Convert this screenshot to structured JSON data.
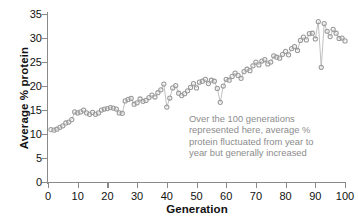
{
  "chart_data": {
    "type": "line",
    "title": "",
    "xlabel": "Generation",
    "ylabel": "Average % protein",
    "xlim": [
      0,
      100
    ],
    "ylim": [
      0,
      35
    ],
    "xticks": [
      0,
      10,
      20,
      30,
      40,
      50,
      60,
      70,
      80,
      90,
      100
    ],
    "yticks": [
      0,
      5,
      10,
      15,
      20,
      25,
      30,
      35
    ],
    "grid": false,
    "legend": null,
    "marker": "open-circle",
    "marker_color": "#9a9a9a",
    "line_color": "#b0b0b0",
    "annotations": [
      {
        "text": "Over the 100 generations represented here, average % protein fluctuated from year to year but generally increased",
        "lines": [
          "Over the 100 generations",
          "represented here, average %",
          "protein fluctuated from year to",
          "year but generally increased"
        ],
        "color": "#8c8c8c",
        "x": 52,
        "y": 12
      }
    ],
    "x": [
      1,
      2,
      3,
      4,
      5,
      6,
      7,
      8,
      9,
      10,
      11,
      12,
      13,
      14,
      15,
      16,
      17,
      18,
      19,
      20,
      21,
      22,
      23,
      24,
      25,
      26,
      27,
      28,
      29,
      30,
      31,
      32,
      33,
      34,
      35,
      36,
      37,
      38,
      39,
      40,
      41,
      42,
      43,
      44,
      45,
      46,
      47,
      48,
      49,
      50,
      51,
      52,
      53,
      54,
      55,
      56,
      57,
      58,
      59,
      60,
      61,
      62,
      63,
      64,
      65,
      66,
      67,
      68,
      69,
      70,
      71,
      72,
      73,
      74,
      75,
      76,
      77,
      78,
      79,
      80,
      81,
      82,
      83,
      84,
      85,
      86,
      87,
      88,
      89,
      90,
      91,
      92,
      93,
      94,
      95,
      96,
      97,
      98,
      99,
      100
    ],
    "values": [
      10.9,
      10.8,
      11.0,
      11.4,
      11.7,
      12.3,
      12.5,
      13.0,
      14.6,
      14.4,
      14.6,
      15.0,
      14.4,
      14.1,
      14.5,
      14.1,
      14.4,
      15.0,
      15.2,
      15.3,
      15.5,
      15.4,
      15.2,
      14.4,
      14.3,
      16.9,
      17.2,
      17.4,
      16.2,
      16.5,
      17.3,
      16.8,
      17.0,
      17.6,
      18.1,
      17.7,
      18.6,
      19.2,
      20.4,
      15.6,
      17.5,
      19.6,
      20.1,
      18.5,
      18.0,
      18.4,
      19.0,
      19.7,
      20.5,
      19.6,
      20.8,
      21.0,
      21.4,
      20.5,
      21.2,
      21.0,
      19.5,
      16.6,
      20.0,
      21.4,
      21.2,
      22.0,
      22.7,
      22.2,
      21.6,
      23.0,
      23.5,
      23.2,
      24.2,
      25.0,
      24.4,
      25.2,
      25.5,
      24.6,
      25.0,
      26.3,
      26.0,
      25.8,
      26.6,
      27.2,
      26.5,
      27.8,
      28.2,
      27.4,
      29.5,
      30.2,
      29.6,
      30.9,
      31.0,
      29.8,
      33.4,
      23.9,
      33.0,
      31.4,
      30.3,
      31.8,
      31.0,
      29.9,
      30.0,
      29.4
    ]
  },
  "axis": {
    "ylabel_text": "Average % protein",
    "xlabel_text": "Generation"
  }
}
